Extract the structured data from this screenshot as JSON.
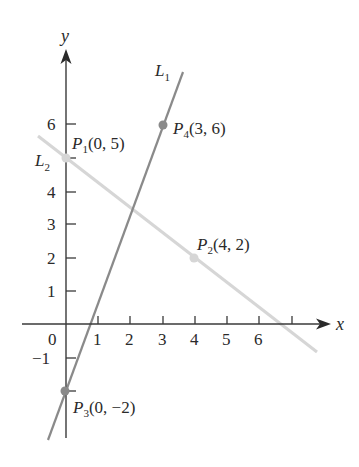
{
  "figure": {
    "type": "coordinate-plane",
    "axes": {
      "x_label": "x",
      "y_label": "y",
      "x_ticks": [
        "0",
        "1",
        "2",
        "3",
        "4",
        "5",
        "6"
      ],
      "y_ticks": [
        "−1",
        "1",
        "2",
        "3",
        "4",
        "5",
        "6"
      ],
      "x_range": [
        -0.5,
        8.3
      ],
      "y_range": [
        -3.4,
        8.3
      ]
    },
    "lines": [
      {
        "name": "L",
        "sub": "1",
        "color": "#8a8a8a",
        "through": [
          "P3",
          "P4"
        ],
        "slope": 8,
        "intercept": -2
      },
      {
        "name": "L",
        "sub": "2",
        "color": "#d6d6d6",
        "through": [
          "P1",
          "P2"
        ],
        "slope": -0.75,
        "intercept": 5
      }
    ],
    "points": [
      {
        "id": "P1",
        "letter": "P",
        "sub": "1",
        "coords": "(0, 5)",
        "x": 0,
        "y": 5,
        "on": "L2"
      },
      {
        "id": "P2",
        "letter": "P",
        "sub": "2",
        "coords": "(4, 2)",
        "x": 4,
        "y": 2,
        "on": "L2"
      },
      {
        "id": "P3",
        "letter": "P",
        "sub": "3",
        "coords": "(0, −2)",
        "x": 0,
        "y": -2,
        "on": "L1"
      },
      {
        "id": "P4",
        "letter": "P",
        "sub": "4",
        "coords": "(3, 6)",
        "x": 3,
        "y": 6,
        "on": "L1"
      }
    ],
    "colors": {
      "axis": "#3a3a3a",
      "line1": "#8a8a8a",
      "line2": "#d6d6d6",
      "point1": "#8a8a8a",
      "point2": "#d6d6d6"
    }
  }
}
